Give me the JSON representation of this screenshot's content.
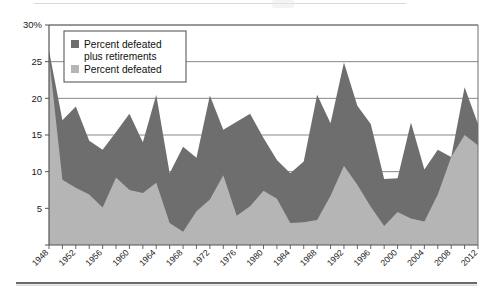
{
  "chart_data": {
    "type": "area",
    "title": "",
    "subtitle": "",
    "xlabel": "",
    "ylabel": "",
    "ylim": [
      0,
      30
    ],
    "xlim": [
      1948,
      2012
    ],
    "grid": true,
    "grid_axis": "y",
    "legend_position": "top-left-inset",
    "stacked": false,
    "y_ticks": [
      0,
      5,
      10,
      15,
      20,
      25,
      30
    ],
    "y_tick_labels": [
      "",
      "5",
      "10",
      "15",
      "20",
      "25",
      "30%"
    ],
    "x_tick_step": 2,
    "x_label_step": 4,
    "x": [
      1948,
      1950,
      1952,
      1954,
      1956,
      1958,
      1960,
      1962,
      1964,
      1966,
      1968,
      1970,
      1972,
      1974,
      1976,
      1978,
      1980,
      1982,
      1984,
      1986,
      1988,
      1990,
      1992,
      1994,
      1996,
      1998,
      2000,
      2002,
      2004,
      2006,
      2008,
      2010,
      2012
    ],
    "categories": [
      "1948",
      "1950",
      "1952",
      "1954",
      "1956",
      "1958",
      "1960",
      "1962",
      "1964",
      "1966",
      "1968",
      "1970",
      "1972",
      "1974",
      "1976",
      "1978",
      "1980",
      "1982",
      "1984",
      "1986",
      "1988",
      "1990",
      "1992",
      "1994",
      "1996",
      "1998",
      "2000",
      "2002",
      "2004",
      "2006",
      "2008",
      "2010",
      "2012"
    ],
    "series": [
      {
        "name": "Percent defeated plus retirements",
        "color": "#6e6e6e",
        "values": [
          26.5,
          17.0,
          18.9,
          14.2,
          13.0,
          15.4,
          17.9,
          14.0,
          20.5,
          9.8,
          13.4,
          11.9,
          20.4,
          15.7,
          16.8,
          17.9,
          14.6,
          11.6,
          9.8,
          11.4,
          20.5,
          16.6,
          24.9,
          19.0,
          16.5,
          9.0,
          9.1,
          16.7,
          10.3,
          13.0,
          12.0,
          21.5,
          16.5
        ]
      },
      {
        "name": "Percent defeated",
        "color": "#b5b5b5",
        "values": [
          25.7,
          8.9,
          7.8,
          6.9,
          5.1,
          9.2,
          7.5,
          7.1,
          8.5,
          3.0,
          1.8,
          4.6,
          6.2,
          9.5,
          4.0,
          5.3,
          7.4,
          6.3,
          3.0,
          3.1,
          3.4,
          6.7,
          10.8,
          8.2,
          5.2,
          2.6,
          4.5,
          3.6,
          3.2,
          6.9,
          12.0,
          15.0,
          13.6
        ]
      }
    ],
    "legend": [
      {
        "label_line1": "Percent defeated",
        "label_line2": "plus retirements",
        "swatch_color": "#6e6e6e"
      },
      {
        "label_line1": "Percent defeated",
        "label_line2": "",
        "swatch_color": "#b5b5b5"
      }
    ],
    "x_labels_shown": [
      "1948",
      "1952",
      "1956",
      "1960",
      "1964",
      "1968",
      "1972",
      "1976",
      "1980",
      "1984",
      "1988",
      "1992",
      "1996",
      "2000",
      "2004",
      "2008",
      "2012"
    ],
    "axis_color": "#555555",
    "grid_color": "#7a7a7a",
    "plot_background": "#ffffff"
  }
}
